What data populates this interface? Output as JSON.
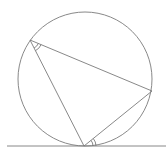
{
  "diagram": {
    "type": "geometry",
    "stroke_color": "#7a7a7a",
    "background": "#ffffff",
    "circle": {
      "cx": 85,
      "cy": 79,
      "r": 67
    },
    "vertices": {
      "A": {
        "x": 30,
        "y": 40
      },
      "B": {
        "x": 152,
        "y": 91
      },
      "C": {
        "x": 84,
        "y": 146
      }
    },
    "tangent_line": {
      "x1": 7,
      "y1": 146,
      "x2": 166,
      "y2": 146
    },
    "angle_marks": [
      {
        "at": "A",
        "between": [
          "B",
          "C"
        ],
        "style": "double-arc"
      },
      {
        "at": "C",
        "between": [
          "B",
          "tangent-right"
        ],
        "style": "double-arc"
      }
    ]
  }
}
